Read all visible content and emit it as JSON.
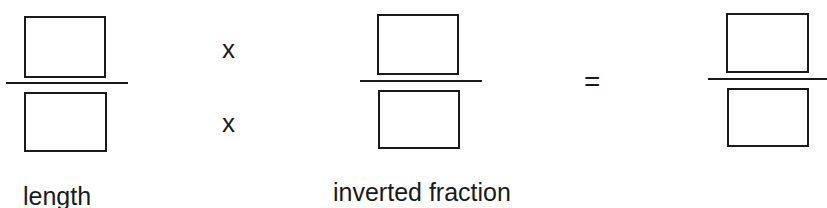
{
  "diagram": {
    "fractions": [
      {
        "name": "length",
        "numerator": "",
        "denominator": ""
      },
      {
        "name": "inverted fraction",
        "numerator": "",
        "denominator": ""
      },
      {
        "name": "result",
        "numerator": "",
        "denominator": ""
      }
    ],
    "operators": {
      "multiply_top": "x",
      "multiply_bottom": "x",
      "equals": "="
    },
    "labels": {
      "fraction1": "length",
      "fraction2": "inverted fraction"
    }
  }
}
